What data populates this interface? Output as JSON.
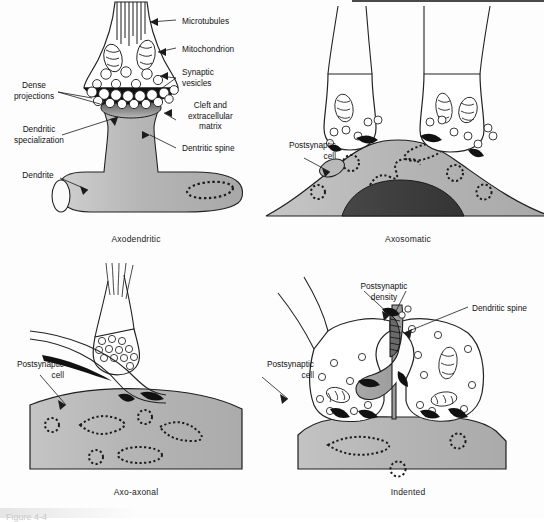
{
  "figure": {
    "background_color": "#fdfdfd",
    "fill_light_gray": "#b9b9b9",
    "fill_mid_gray": "#9c9c9c",
    "fill_dark_gray": "#3a3a3a",
    "stroke_color": "#1b1b1b",
    "partial_caption": "Figure 4-4"
  },
  "panels": [
    {
      "id": "axodendritic",
      "caption": "Axodendritic",
      "labels": [
        {
          "name": "microtubules",
          "text": "Microtubules"
        },
        {
          "name": "mitochondrion",
          "text": "Mitochondrion"
        },
        {
          "name": "synaptic-vesicles",
          "text": "Synaptic\nvesicles"
        },
        {
          "name": "cleft-extracellular",
          "text": "Cleft and\nextracellular\nmatrix"
        },
        {
          "name": "dentritic-spine",
          "text": "Dentritic spine"
        },
        {
          "name": "dense-projections",
          "text": "Dense\nprojections"
        },
        {
          "name": "dendritic-specialization",
          "text": "Dendritic\nspecialization"
        },
        {
          "name": "dendrite",
          "text": "Dendrite"
        }
      ]
    },
    {
      "id": "axosomatic",
      "caption": "Axosomatic",
      "labels": [
        {
          "name": "postsynaptic-cell",
          "text": "Postsynaptic\ncell"
        }
      ]
    },
    {
      "id": "axo-axonal",
      "caption": "Axo-axonal",
      "labels": [
        {
          "name": "postsynaptic-cell",
          "text": "Postsynaptic\ncell"
        }
      ]
    },
    {
      "id": "indented",
      "caption": "Indented",
      "labels": [
        {
          "name": "postsynaptic-density",
          "text": "Postsynaptic\ndensity"
        },
        {
          "name": "dendritic-spine",
          "text": "Dendritic spine"
        },
        {
          "name": "postsynaptic-cell",
          "text": "Postsynaptic\ncell"
        }
      ]
    }
  ]
}
